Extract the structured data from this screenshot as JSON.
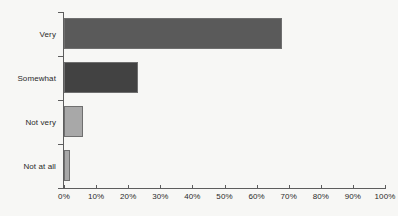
{
  "chart_data": {
    "type": "bar",
    "orientation": "horizontal",
    "title": "",
    "subtitle": "",
    "xlabel": "",
    "ylabel": "",
    "categories": [
      "Very",
      "Somewhat",
      "Not very",
      "Not at all"
    ],
    "values": [
      68,
      23,
      6,
      2
    ],
    "value_labels": [
      "68%",
      "23%",
      "6%",
      "2%"
    ],
    "series": [
      {
        "name": "",
        "values": [
          68,
          23,
          6,
          2
        ]
      }
    ],
    "xlim": [
      0,
      100
    ],
    "x_ticks": [
      0,
      10,
      20,
      30,
      40,
      50,
      60,
      70,
      80,
      90,
      100
    ],
    "x_tick_labels": [
      "0%",
      "10%",
      "20%",
      "30%",
      "40%",
      "50%",
      "60%",
      "70%",
      "80%",
      "90%",
      "100%"
    ],
    "grid": false,
    "legend": false,
    "legend_position": "none",
    "bar_colors": [
      "#5a5a5a",
      "#424242",
      "#a8a8a8",
      "#a8a8a8"
    ],
    "bar_border_color": "#6f6f6f",
    "axis_color": "#5d5d5d",
    "background_color": "#f7f7f5",
    "text_color": "#2a2a2a"
  }
}
